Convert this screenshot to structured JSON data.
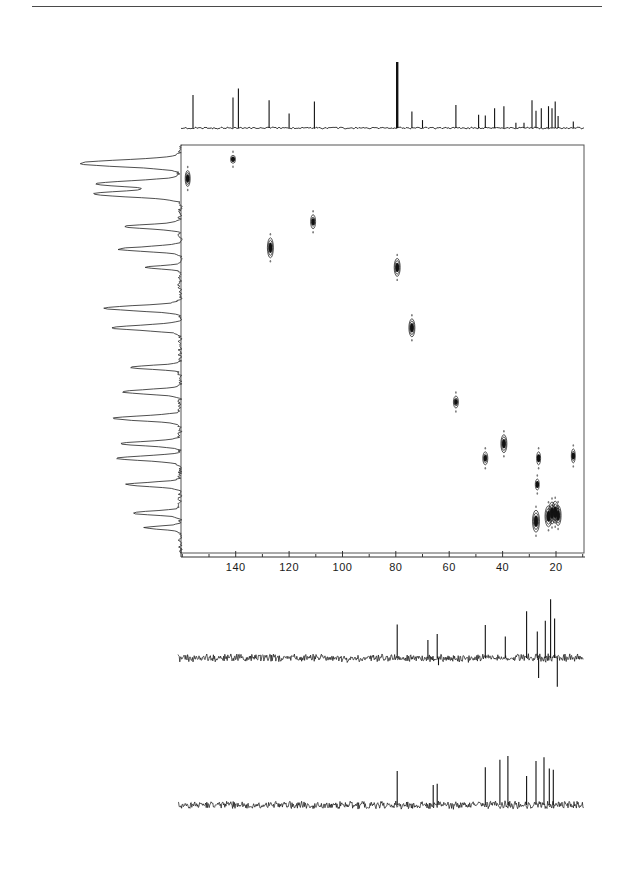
{
  "figure": {
    "background_color": "#ffffff",
    "ink_color": "#111111",
    "rule_color": "#4a4a4a"
  },
  "axis": {
    "name": "carbon-13-chemical-shift-axis",
    "unit": "ppm",
    "direction": "reversed",
    "pixel_left": 181,
    "pixel_right": 584,
    "ppm_at_left": 160.5,
    "ppm_at_right": 9.5,
    "major_ticks": [
      140,
      120,
      100,
      80,
      60,
      40,
      20
    ],
    "major_tick_labels": [
      "140",
      "120",
      "100",
      "80",
      "60",
      "40",
      "20"
    ],
    "minor_tick_step": 10
  },
  "contour_panel": {
    "name": "hsqc-contour-panel",
    "x": 181,
    "y": 145,
    "width": 403,
    "height": 408,
    "border_color": "#555555",
    "f2_range_ppm": [
      160.5,
      9.5
    ],
    "f1_label": "1H",
    "f2_label": "13C"
  },
  "chart_data": {
    "type": "scatter",
    "xlabel": "13C chemical shift (ppm)",
    "ylabel": "1H chemical shift (ppm)",
    "xlim": [
      160.5,
      9.5
    ],
    "ylim": [
      0,
      1
    ],
    "grid": false,
    "legend": "none",
    "cross_peaks": [
      {
        "label": "CH aromatic",
        "c_ppm": 158.0,
        "h_rel": 0.918,
        "w": 5,
        "h": 16,
        "intensity": "strong"
      },
      {
        "label": "CH aromatic 2",
        "c_ppm": 141.0,
        "h_rel": 0.965,
        "w": 5,
        "h": 8,
        "intensity": "weak"
      },
      {
        "label": "CH olefinic",
        "c_ppm": 127.0,
        "h_rel": 0.748,
        "w": 6,
        "h": 20,
        "intensity": "strong"
      },
      {
        "label": "CH olefinic 2",
        "c_ppm": 111.0,
        "h_rel": 0.812,
        "w": 5,
        "h": 14,
        "intensity": "medium"
      },
      {
        "label": "CH oxygenated",
        "c_ppm": 79.5,
        "h_rel": 0.7,
        "w": 6,
        "h": 18,
        "intensity": "strong"
      },
      {
        "label": "CH oxygenated 2",
        "c_ppm": 74.0,
        "h_rel": 0.552,
        "w": 6,
        "h": 18,
        "intensity": "strong"
      },
      {
        "label": "CH methine",
        "c_ppm": 57.5,
        "h_rel": 0.37,
        "w": 5,
        "h": 12,
        "intensity": "medium"
      },
      {
        "label": "CH2 aliphatic",
        "c_ppm": 46.5,
        "h_rel": 0.232,
        "w": 5,
        "h": 13,
        "intensity": "medium"
      },
      {
        "label": "CH2 aliphatic 2",
        "c_ppm": 39.5,
        "h_rel": 0.268,
        "w": 6,
        "h": 18,
        "intensity": "strong"
      },
      {
        "label": "CH cluster a",
        "c_ppm": 27.5,
        "h_rel": 0.078,
        "w": 7,
        "h": 22,
        "intensity": "strong"
      },
      {
        "label": "CH3 cluster b",
        "c_ppm": 22.8,
        "h_rel": 0.09,
        "w": 7,
        "h": 21,
        "intensity": "strong"
      },
      {
        "label": "CH3 cluster c",
        "c_ppm": 21.5,
        "h_rel": 0.098,
        "w": 7,
        "h": 22,
        "intensity": "strong"
      },
      {
        "label": "CH3 cluster d",
        "c_ppm": 20.3,
        "h_rel": 0.1,
        "w": 7,
        "h": 22,
        "intensity": "strong"
      },
      {
        "label": "CH3 cluster e",
        "c_ppm": 19.2,
        "h_rel": 0.092,
        "w": 6,
        "h": 20,
        "intensity": "strong"
      },
      {
        "label": "CH2 mid",
        "c_ppm": 27.0,
        "h_rel": 0.168,
        "w": 4,
        "h": 11,
        "intensity": "weak"
      },
      {
        "label": "CH2 mid 2",
        "c_ppm": 26.5,
        "h_rel": 0.232,
        "w": 4,
        "h": 13,
        "intensity": "weak"
      },
      {
        "label": "CH3 edge",
        "c_ppm": 13.5,
        "h_rel": 0.238,
        "w": 4,
        "h": 14,
        "intensity": "medium"
      }
    ],
    "carbon_projection": {
      "name": "carbon-1d-projection",
      "peaks_ppm": [
        156.0,
        141.0,
        139.0,
        127.5,
        120.0,
        110.5,
        79.5,
        74.0,
        70.0,
        57.5,
        49.0,
        46.5,
        43.0,
        39.5,
        35.0,
        32.0,
        29.0,
        27.5,
        25.5,
        22.8,
        21.5,
        20.3,
        19.2,
        13.5
      ],
      "peak_heights": [
        0.5,
        0.46,
        0.6,
        0.42,
        0.22,
        0.4,
        1.0,
        0.25,
        0.12,
        0.35,
        0.2,
        0.19,
        0.3,
        0.33,
        0.08,
        0.08,
        0.42,
        0.26,
        0.3,
        0.33,
        0.3,
        0.4,
        0.18,
        0.1
      ]
    },
    "proton_projection": {
      "name": "proton-1d-projection",
      "description": "vertical 1H trace along left edge, 13 resolved multiplets",
      "peaks_rel": [
        0.955,
        0.905,
        0.88,
        0.8,
        0.745,
        0.7,
        0.6,
        0.552,
        0.455,
        0.395,
        0.33,
        0.268,
        0.232,
        0.168,
        0.098,
        0.062
      ],
      "peak_widths": [
        0.62,
        0.5,
        0.52,
        0.28,
        0.32,
        0.12,
        0.42,
        0.38,
        0.22,
        0.3,
        0.36,
        0.3,
        0.34,
        0.26,
        0.22,
        0.12
      ]
    },
    "dept_135": {
      "name": "dept-135-spectrum",
      "label": "DEPT 135",
      "positive_peaks_ppm": [
        79.5,
        68.0,
        64.5,
        46.5,
        39.0,
        31.0,
        27.0,
        24.0,
        22.0,
        20.5
      ],
      "positive_heights": [
        0.56,
        0.3,
        0.4,
        0.55,
        0.36,
        0.78,
        0.44,
        0.62,
        0.98,
        0.66
      ],
      "negative_peaks_ppm": [
        64.0,
        26.5,
        19.5
      ],
      "negative_heights": [
        0.18,
        0.5,
        0.72
      ],
      "baseline_noise": true
    },
    "dept_90": {
      "name": "dept-90-spectrum",
      "label": "DEPT 90",
      "positive_peaks_ppm": [
        79.5,
        66.0,
        64.5,
        46.5,
        41.0,
        38.0,
        31.0,
        27.5,
        24.5,
        22.5,
        21.0
      ],
      "positive_heights": [
        0.54,
        0.32,
        0.34,
        0.6,
        0.72,
        0.78,
        0.46,
        0.7,
        0.76,
        0.58,
        0.56
      ],
      "negative_peaks_ppm": [],
      "negative_heights": [],
      "baseline_noise": true
    }
  },
  "panels": {
    "carbon_projection_panel": {
      "x": 181,
      "y": 58,
      "width": 403,
      "height": 70
    },
    "proton_projection_panel": {
      "x": 22,
      "y": 145,
      "width": 158,
      "height": 408
    },
    "dept135_panel": {
      "x": 178,
      "y": 596,
      "width": 406,
      "height": 100
    },
    "dept90_panel": {
      "x": 178,
      "y": 740,
      "width": 406,
      "height": 105
    }
  }
}
